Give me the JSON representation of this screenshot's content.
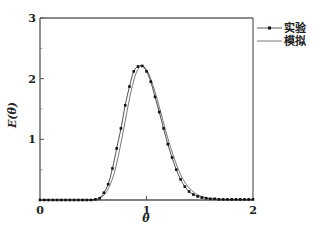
{
  "chart_data": {
    "type": "line",
    "title": "",
    "xlabel": "θ",
    "ylabel": "E(θ)",
    "xlim": [
      0,
      2
    ],
    "ylim": [
      0,
      3
    ],
    "xticks": [
      0,
      1,
      2
    ],
    "yticks": [
      1,
      2,
      3
    ],
    "y_minor_ticks": [
      0.5,
      1.5,
      2.5
    ],
    "grid": false,
    "legend_position": "outside-top-right",
    "series": [
      {
        "name": "实验",
        "style": "line-with-markers",
        "x": [
          0.0,
          0.04,
          0.08,
          0.12,
          0.16,
          0.2,
          0.24,
          0.28,
          0.32,
          0.36,
          0.4,
          0.44,
          0.48,
          0.52,
          0.56,
          0.6,
          0.64,
          0.68,
          0.72,
          0.76,
          0.8,
          0.84,
          0.88,
          0.92,
          0.96,
          1.0,
          1.04,
          1.08,
          1.12,
          1.16,
          1.2,
          1.24,
          1.28,
          1.32,
          1.36,
          1.4,
          1.44,
          1.48,
          1.52,
          1.56,
          1.6,
          1.64,
          1.68,
          1.72,
          1.76,
          1.8,
          1.84,
          1.88,
          1.92,
          1.96,
          2.0
        ],
        "y": [
          0,
          0,
          0,
          0,
          0,
          0,
          0,
          0,
          0,
          0,
          0,
          0,
          0,
          0.01,
          0.03,
          0.12,
          0.26,
          0.52,
          0.85,
          1.18,
          1.56,
          1.87,
          2.12,
          2.2,
          2.21,
          2.12,
          1.95,
          1.7,
          1.45,
          1.18,
          0.92,
          0.7,
          0.5,
          0.34,
          0.22,
          0.14,
          0.09,
          0.06,
          0.04,
          0.03,
          0.02,
          0.02,
          0.01,
          0.01,
          0.01,
          0.01,
          0.01,
          0.01,
          0.01,
          0.01,
          0.01
        ]
      },
      {
        "name": "模拟",
        "style": "line",
        "x": [
          0.0,
          0.4,
          0.5,
          0.55,
          0.6,
          0.65,
          0.7,
          0.75,
          0.8,
          0.85,
          0.9,
          0.95,
          1.0,
          1.05,
          1.1,
          1.15,
          1.2,
          1.25,
          1.3,
          1.35,
          1.4,
          1.45,
          1.5,
          1.6,
          1.7,
          1.8,
          2.0
        ],
        "y": [
          0,
          0,
          0,
          0.02,
          0.08,
          0.22,
          0.46,
          0.85,
          1.3,
          1.75,
          2.08,
          2.21,
          2.15,
          1.95,
          1.66,
          1.34,
          1.02,
          0.74,
          0.5,
          0.32,
          0.2,
          0.12,
          0.07,
          0.02,
          0.01,
          0,
          0
        ]
      }
    ]
  },
  "legend": {
    "items": [
      {
        "label": "实验",
        "marker": "dot-line"
      },
      {
        "label": "模拟",
        "marker": "line"
      }
    ]
  },
  "axes": {
    "x_tick_labels": [
      "0",
      "1",
      "2"
    ],
    "y_tick_labels": [
      "1",
      "2",
      "3"
    ],
    "xlabel": "θ",
    "ylabel": "E(θ)"
  },
  "colors": {
    "frame": "#555555",
    "experiment": "#222222",
    "simulation": "#666666"
  }
}
